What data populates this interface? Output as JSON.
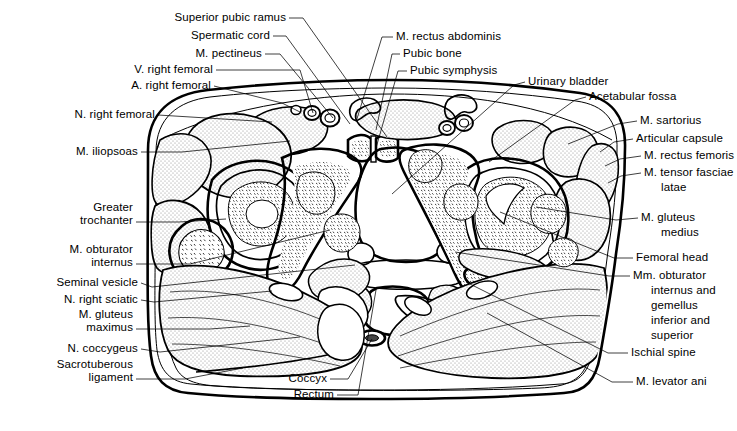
{
  "figure": {
    "background_color": "#ffffff",
    "ink_color": "#000000",
    "stipple_color": "#7a7a7a"
  },
  "labels_left": [
    {
      "id": "superior-pubic-ramus",
      "text": "Superior pubic ramus",
      "x": 286,
      "y": 21,
      "align": "right"
    },
    {
      "id": "spermatic-cord",
      "text": "Spermatic cord",
      "x": 270,
      "y": 39,
      "align": "right"
    },
    {
      "id": "m-pectineus",
      "text": "M. pectineus",
      "x": 262,
      "y": 57,
      "align": "right"
    },
    {
      "id": "v-right-femoral",
      "text": "V. right femoral",
      "x": 213,
      "y": 73,
      "align": "right"
    },
    {
      "id": "a-right-femoral",
      "text": "A. right femoral",
      "x": 211,
      "y": 89,
      "align": "right"
    },
    {
      "id": "n-right-femoral",
      "text": "N. right femoral",
      "x": 155,
      "y": 118,
      "align": "right"
    },
    {
      "id": "m-iliopsoas",
      "text": "M. iliopsoas",
      "x": 138,
      "y": 155,
      "align": "right"
    },
    {
      "id": "greater-trochanter",
      "text": "Greater\ntrochanter",
      "x": 133,
      "y": 211,
      "align": "right"
    },
    {
      "id": "m-obturator-internus",
      "text": "M. obturator\ninternus",
      "x": 133,
      "y": 253,
      "align": "right"
    },
    {
      "id": "seminal-vesicle",
      "text": "Seminal vesicle",
      "x": 138,
      "y": 286,
      "align": "right"
    },
    {
      "id": "n-right-sciatic",
      "text": "N. right sciatic",
      "x": 138,
      "y": 303,
      "align": "right"
    },
    {
      "id": "m-gluteus-maximus",
      "text": "M. gluteus\nmaximus",
      "x": 133,
      "y": 318,
      "align": "right"
    },
    {
      "id": "n-coccygeus",
      "text": "N. coccygeus",
      "x": 138,
      "y": 352,
      "align": "right"
    },
    {
      "id": "sacrotuberous-ligament",
      "text": "Sacrotuberous\nligament",
      "x": 133,
      "y": 368,
      "align": "right"
    }
  ],
  "labels_right": [
    {
      "id": "m-rectus-abdominis",
      "text": "M. rectus abdominis",
      "x": 396,
      "y": 40,
      "align": "left"
    },
    {
      "id": "pubic-bone",
      "text": "Pubic bone",
      "x": 403,
      "y": 57,
      "align": "left"
    },
    {
      "id": "pubic-symphysis",
      "text": "Pubic symphysis",
      "x": 410,
      "y": 74,
      "align": "left"
    },
    {
      "id": "urinary-bladder",
      "text": "Urinary bladder",
      "x": 528,
      "y": 85,
      "align": "left"
    },
    {
      "id": "acetabular-fossa",
      "text": "Acetabular fossa",
      "x": 589,
      "y": 100,
      "align": "left"
    },
    {
      "id": "m-sartorius",
      "text": "M. sartorius",
      "x": 640,
      "y": 124,
      "align": "left"
    },
    {
      "id": "articular-capsule",
      "text": "Articular capsule",
      "x": 636,
      "y": 142,
      "align": "left"
    },
    {
      "id": "m-rectus-femoris",
      "text": "M. rectus femoris",
      "x": 644,
      "y": 159,
      "align": "left"
    },
    {
      "id": "m-tensor-fasciae-latae",
      "text": "M. tensor fasciae",
      "x": 644,
      "y": 176,
      "align": "left"
    },
    {
      "id": "m-tensor-fasciae-latae-2",
      "text": "latae",
      "x": 661,
      "y": 191,
      "align": "left"
    },
    {
      "id": "m-gluteus-medius",
      "text": "M. gluteus",
      "x": 641,
      "y": 221,
      "align": "left"
    },
    {
      "id": "m-gluteus-medius-2",
      "text": "medius",
      "x": 661,
      "y": 236,
      "align": "left"
    },
    {
      "id": "femoral-head",
      "text": "Femoral head",
      "x": 636,
      "y": 261,
      "align": "left"
    },
    {
      "id": "mm-obturator-internus-gemellus",
      "text": "Mm. obturator",
      "x": 633,
      "y": 279,
      "align": "left"
    },
    {
      "id": "mm-obturator-l2",
      "text": "internus and",
      "x": 651,
      "y": 294,
      "align": "left"
    },
    {
      "id": "mm-obturator-l3",
      "text": "gemellus",
      "x": 651,
      "y": 309,
      "align": "left"
    },
    {
      "id": "mm-obturator-l4",
      "text": "inferior and",
      "x": 651,
      "y": 324,
      "align": "left"
    },
    {
      "id": "mm-obturator-l5",
      "text": "superior",
      "x": 651,
      "y": 339,
      "align": "left"
    },
    {
      "id": "ischial-spine",
      "text": "Ischial spine",
      "x": 631,
      "y": 356,
      "align": "left"
    },
    {
      "id": "m-levator-ani",
      "text": "M. levator ani",
      "x": 636,
      "y": 385,
      "align": "left"
    }
  ],
  "labels_bottom": [
    {
      "id": "coccyx",
      "text": "Coccyx",
      "x": 327,
      "y": 382,
      "align": "right"
    },
    {
      "id": "rectum",
      "text": "Rectum",
      "x": 334,
      "y": 398,
      "align": "right"
    }
  ],
  "leaders": [
    {
      "id": "leader-superior-pubic-ramus",
      "d": "M289,18 L303,18 L387,137"
    },
    {
      "id": "leader-spermatic-cord",
      "d": "M273,36 L286,36 L350,124"
    },
    {
      "id": "leader-m-pectineus",
      "d": "M265,54 L280,54 L333,118"
    },
    {
      "id": "leader-v-right-femoral",
      "d": "M216,70 L300,70 L313,113"
    },
    {
      "id": "leader-a-right-femoral",
      "d": "M214,86 L282,103 L300,112"
    },
    {
      "id": "leader-n-right-femoral",
      "d": "M158,115 L272,122"
    },
    {
      "id": "leader-m-iliopsoas",
      "d": "M141,152 L182,152 L290,141"
    },
    {
      "id": "leader-greater-trochanter",
      "d": "M136,222 L179,222 L226,219"
    },
    {
      "id": "leader-m-obturator-internus",
      "d": "M136,264 L190,264 L330,230"
    },
    {
      "id": "leader-seminal-vesicle",
      "d": "M141,283 L152,287 L355,265"
    },
    {
      "id": "leader-n-right-sciatic",
      "d": "M141,300 L154,302 L272,291"
    },
    {
      "id": "leader-m-gluteus-maximus",
      "d": "M136,329 L210,329 L250,326"
    },
    {
      "id": "leader-n-coccygeus",
      "d": "M141,349 L160,352 L300,337"
    },
    {
      "id": "leader-sacrotuberous-lig",
      "d": "M136,379 L185,379 L243,368"
    },
    {
      "id": "leader-m-rectus-abdominis",
      "d": "M393,37 L382,37 L356,122"
    },
    {
      "id": "leader-pubic-bone",
      "d": "M400,54 L392,54 L376,130"
    },
    {
      "id": "leader-pubic-symphysis",
      "d": "M407,71 L398,71 L376,148"
    },
    {
      "id": "leader-urinary-bladder",
      "d": "M525,82 L514,85 L392,194"
    },
    {
      "id": "leader-acetabular-fossa",
      "d": "M586,97 L575,100 L489,162"
    },
    {
      "id": "leader-m-sartorius",
      "d": "M637,121 L618,124 L568,144"
    },
    {
      "id": "leader-articular-capsule",
      "d": "M633,139 L614,142 L600,152"
    },
    {
      "id": "leader-m-rectus-femoris",
      "d": "M641,156 L620,159 L605,166"
    },
    {
      "id": "leader-m-tensor-fasciae",
      "d": "M641,173 L621,176 L608,183"
    },
    {
      "id": "leader-m-gluteus-medius",
      "d": "M638,218 L616,220 L536,207"
    },
    {
      "id": "leader-femoral-head",
      "d": "M633,258 L614,258 L500,212"
    },
    {
      "id": "leader-mm-obturator",
      "d": "M630,276 L609,276 L455,252"
    },
    {
      "id": "leader-ischial-spine",
      "d": "M628,353 L608,353 L466,282"
    },
    {
      "id": "leader-m-levator-ani",
      "d": "M633,382 L612,382 L487,313"
    },
    {
      "id": "leader-coccyx",
      "d": "M330,379 L348,379 L372,339"
    },
    {
      "id": "leader-rectum",
      "d": "M337,395 L358,395 L376,290"
    }
  ]
}
